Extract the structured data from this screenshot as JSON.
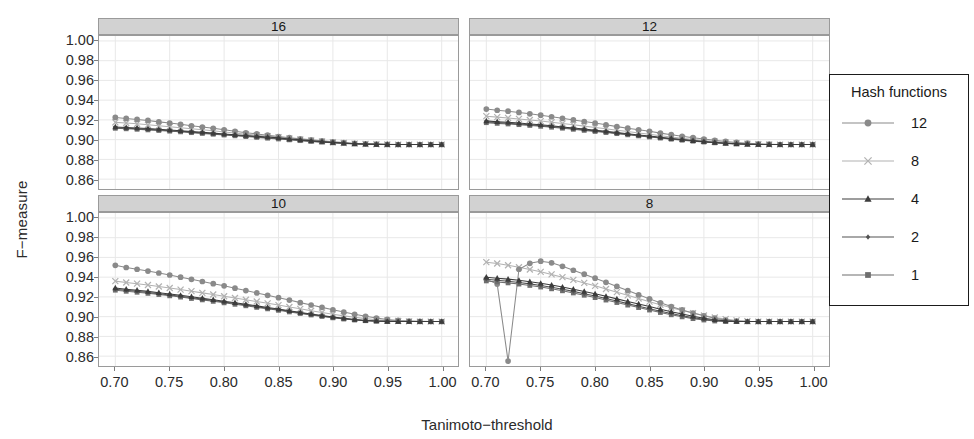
{
  "chart_data": {
    "type": "line",
    "title": "",
    "xlabel": "Tanimoto−threshold",
    "ylabel": "F−measure",
    "xlim": [
      0.685,
      1.015
    ],
    "ylim": [
      0.85,
      1.005
    ],
    "xticks": [
      "0.70",
      "0.75",
      "0.80",
      "0.85",
      "0.90",
      "0.95",
      "1.00"
    ],
    "xtick_values": [
      0.7,
      0.75,
      0.8,
      0.85,
      0.9,
      0.95,
      1.0
    ],
    "yticks": [
      "1.00",
      "0.98",
      "0.96",
      "0.94",
      "0.92",
      "0.90",
      "0.88",
      "0.86"
    ],
    "ytick_values": [
      1.0,
      0.98,
      0.96,
      0.94,
      0.92,
      0.9,
      0.88,
      0.86
    ],
    "grid": true,
    "grid_color": "#e8e8e8",
    "legend": {
      "title": "Hash functions",
      "position": "right",
      "entries": [
        {
          "label": "12",
          "marker": "circle",
          "color": "#8a8a8a"
        },
        {
          "label": "8",
          "marker": "cross",
          "color": "#b2b2b2"
        },
        {
          "label": "4",
          "marker": "triangle",
          "color": "#3c3c3c"
        },
        {
          "label": "2",
          "marker": "diamond",
          "color": "#525252"
        },
        {
          "label": "1",
          "marker": "square",
          "color": "#6e6e6e"
        }
      ]
    },
    "facet_variable": "Bits",
    "facets": [
      {
        "strip": "16",
        "row": 0,
        "col": 0,
        "x": [
          0.7,
          0.71,
          0.72,
          0.73,
          0.74,
          0.75,
          0.76,
          0.77,
          0.78,
          0.79,
          0.8,
          0.81,
          0.82,
          0.83,
          0.84,
          0.85,
          0.86,
          0.87,
          0.88,
          0.89,
          0.9,
          0.91,
          0.92,
          0.93,
          0.94,
          0.95,
          0.96,
          0.97,
          0.98,
          0.99,
          1.0
        ],
        "series": [
          {
            "name": "12",
            "values": [
              0.9225,
              0.9215,
              0.9205,
              0.9195,
              0.918,
              0.9168,
              0.9155,
              0.914,
              0.9128,
              0.9115,
              0.91,
              0.9085,
              0.907,
              0.9058,
              0.9045,
              0.9032,
              0.902,
              0.9008,
              0.8998,
              0.8988,
              0.8978,
              0.897,
              0.8962,
              0.8958,
              0.8955,
              0.8952,
              0.895,
              0.895,
              0.895,
              0.895,
              0.895
            ]
          },
          {
            "name": "8",
            "values": [
              0.9175,
              0.9168,
              0.916,
              0.915,
              0.914,
              0.913,
              0.912,
              0.911,
              0.91,
              0.909,
              0.9078,
              0.9068,
              0.9055,
              0.9045,
              0.9035,
              0.9025,
              0.9012,
              0.9002,
              0.8992,
              0.8982,
              0.8974,
              0.8966,
              0.896,
              0.8956,
              0.8953,
              0.8951,
              0.895,
              0.895,
              0.895,
              0.895,
              0.895
            ]
          },
          {
            "name": "4",
            "values": [
              0.9128,
              0.9122,
              0.9118,
              0.9112,
              0.9105,
              0.9098,
              0.909,
              0.9082,
              0.9074,
              0.9066,
              0.9058,
              0.905,
              0.9042,
              0.9034,
              0.9026,
              0.9018,
              0.9006,
              0.8998,
              0.8988,
              0.898,
              0.8972,
              0.8965,
              0.8959,
              0.8955,
              0.8952,
              0.8951,
              0.895,
              0.895,
              0.895,
              0.895,
              0.895
            ]
          },
          {
            "name": "2",
            "values": [
              0.912,
              0.9115,
              0.911,
              0.9104,
              0.9098,
              0.9091,
              0.9084,
              0.9076,
              0.9068,
              0.906,
              0.9052,
              0.9044,
              0.9036,
              0.9028,
              0.902,
              0.9012,
              0.9002,
              0.8994,
              0.8985,
              0.8977,
              0.897,
              0.8963,
              0.8958,
              0.8954,
              0.8952,
              0.8951,
              0.895,
              0.895,
              0.895,
              0.895,
              0.895
            ]
          },
          {
            "name": "1",
            "values": [
              0.9115,
              0.911,
              0.9105,
              0.9099,
              0.9093,
              0.9086,
              0.9079,
              0.9071,
              0.9063,
              0.9055,
              0.9047,
              0.9039,
              0.9031,
              0.9023,
              0.9015,
              0.9007,
              0.8998,
              0.899,
              0.8982,
              0.8975,
              0.8968,
              0.8962,
              0.8957,
              0.8953,
              0.8951,
              0.895,
              0.895,
              0.895,
              0.895,
              0.895,
              0.895
            ]
          }
        ]
      },
      {
        "strip": "12",
        "row": 0,
        "col": 1,
        "x": [
          0.7,
          0.71,
          0.72,
          0.73,
          0.74,
          0.75,
          0.76,
          0.77,
          0.78,
          0.79,
          0.8,
          0.81,
          0.82,
          0.83,
          0.84,
          0.85,
          0.86,
          0.87,
          0.88,
          0.89,
          0.9,
          0.91,
          0.92,
          0.93,
          0.94,
          0.95,
          0.96,
          0.97,
          0.98,
          0.99,
          1.0
        ],
        "series": [
          {
            "name": "12",
            "values": [
              0.931,
              0.9298,
              0.9288,
              0.9276,
              0.9262,
              0.9248,
              0.9232,
              0.9216,
              0.92,
              0.9184,
              0.9168,
              0.915,
              0.9132,
              0.9116,
              0.91,
              0.9084,
              0.9066,
              0.905,
              0.9034,
              0.902,
              0.9006,
              0.8994,
              0.8982,
              0.8972,
              0.8964,
              0.8958,
              0.8954,
              0.8951,
              0.895,
              0.895,
              0.895
            ]
          },
          {
            "name": "8",
            "values": [
              0.9238,
              0.9228,
              0.922,
              0.921,
              0.9199,
              0.9188,
              0.9176,
              0.9163,
              0.915,
              0.9137,
              0.9124,
              0.911,
              0.9096,
              0.9082,
              0.9068,
              0.9054,
              0.904,
              0.9026,
              0.9014,
              0.9002,
              0.899,
              0.898,
              0.8971,
              0.8964,
              0.8958,
              0.8954,
              0.8951,
              0.895,
              0.895,
              0.895,
              0.895
            ]
          },
          {
            "name": "4",
            "values": [
              0.919,
              0.9182,
              0.9176,
              0.9168,
              0.9159,
              0.915,
              0.914,
              0.9129,
              0.9118,
              0.9107,
              0.9096,
              0.9084,
              0.9072,
              0.906,
              0.9048,
              0.9036,
              0.9024,
              0.9012,
              0.9001,
              0.899,
              0.898,
              0.8971,
              0.8964,
              0.8958,
              0.8954,
              0.8951,
              0.895,
              0.895,
              0.895,
              0.895,
              0.895
            ]
          },
          {
            "name": "2",
            "values": [
              0.918,
              0.9173,
              0.9167,
              0.9159,
              0.9151,
              0.9142,
              0.9132,
              0.9122,
              0.9111,
              0.91,
              0.9089,
              0.9078,
              0.9066,
              0.9054,
              0.9043,
              0.9031,
              0.902,
              0.9008,
              0.8998,
              0.8988,
              0.8978,
              0.897,
              0.8963,
              0.8957,
              0.8953,
              0.8951,
              0.895,
              0.895,
              0.895,
              0.895,
              0.895
            ]
          },
          {
            "name": "1",
            "values": [
              0.9172,
              0.9165,
              0.9159,
              0.9152,
              0.9144,
              0.9135,
              0.9126,
              0.9116,
              0.9105,
              0.9094,
              0.9083,
              0.9072,
              0.9061,
              0.9049,
              0.9038,
              0.9027,
              0.9016,
              0.9005,
              0.8995,
              0.8985,
              0.8976,
              0.8968,
              0.8962,
              0.8956,
              0.8953,
              0.8951,
              0.895,
              0.895,
              0.895,
              0.895,
              0.895
            ]
          }
        ]
      },
      {
        "strip": "10",
        "row": 1,
        "col": 0,
        "x": [
          0.7,
          0.71,
          0.72,
          0.73,
          0.74,
          0.75,
          0.76,
          0.77,
          0.78,
          0.79,
          0.8,
          0.81,
          0.82,
          0.83,
          0.84,
          0.85,
          0.86,
          0.87,
          0.88,
          0.89,
          0.9,
          0.91,
          0.92,
          0.93,
          0.94,
          0.95,
          0.96,
          0.97,
          0.98,
          0.99,
          1.0
        ],
        "series": [
          {
            "name": "12",
            "values": [
              0.952,
              0.9498,
              0.948,
              0.9462,
              0.9442,
              0.9422,
              0.94,
              0.9378,
              0.9356,
              0.9334,
              0.9312,
              0.9288,
              0.9264,
              0.924,
              0.9216,
              0.9192,
              0.9168,
              0.9142,
              0.9118,
              0.9094,
              0.907,
              0.9046,
              0.9024,
              0.9004,
              0.8986,
              0.8972,
              0.8962,
              0.8956,
              0.8952,
              0.895,
              0.895
            ]
          },
          {
            "name": "8",
            "values": [
              0.936,
              0.9346,
              0.9334,
              0.932,
              0.9305,
              0.929,
              0.9274,
              0.9258,
              0.9241,
              0.9224,
              0.9207,
              0.9189,
              0.9171,
              0.9153,
              0.9135,
              0.9117,
              0.9098,
              0.9079,
              0.906,
              0.9042,
              0.9024,
              0.9008,
              0.8993,
              0.898,
              0.8969,
              0.8961,
              0.8956,
              0.8952,
              0.895,
              0.895,
              0.895
            ]
          },
          {
            "name": "4",
            "values": [
              0.929,
              0.9278,
              0.9268,
              0.9256,
              0.9243,
              0.923,
              0.9216,
              0.9202,
              0.9187,
              0.9172,
              0.9157,
              0.9141,
              0.9125,
              0.9109,
              0.9093,
              0.9077,
              0.906,
              0.9043,
              0.9027,
              0.9011,
              0.8996,
              0.8983,
              0.8971,
              0.8962,
              0.8956,
              0.8952,
              0.895,
              0.895,
              0.895,
              0.895,
              0.895
            ]
          },
          {
            "name": "2",
            "values": [
              0.9278,
              0.9267,
              0.9257,
              0.9245,
              0.9233,
              0.922,
              0.9206,
              0.9192,
              0.9178,
              0.9163,
              0.9148,
              0.9133,
              0.9117,
              0.9101,
              0.9086,
              0.907,
              0.9054,
              0.9038,
              0.9022,
              0.9007,
              0.8992,
              0.898,
              0.8969,
              0.8961,
              0.8955,
              0.8952,
              0.895,
              0.895,
              0.895,
              0.895,
              0.895
            ]
          },
          {
            "name": "1",
            "values": [
              0.9268,
              0.9257,
              0.9247,
              0.9236,
              0.9224,
              0.9211,
              0.9198,
              0.9184,
              0.917,
              0.9155,
              0.914,
              0.9125,
              0.911,
              0.9094,
              0.9079,
              0.9064,
              0.9048,
              0.9032,
              0.9017,
              0.9002,
              0.8988,
              0.8976,
              0.8966,
              0.8959,
              0.8954,
              0.8951,
              0.895,
              0.895,
              0.895,
              0.895,
              0.895
            ]
          }
        ]
      },
      {
        "strip": "8",
        "row": 1,
        "col": 1,
        "x": [
          0.7,
          0.71,
          0.72,
          0.73,
          0.74,
          0.75,
          0.76,
          0.77,
          0.78,
          0.79,
          0.8,
          0.81,
          0.82,
          0.83,
          0.84,
          0.85,
          0.86,
          0.87,
          0.88,
          0.89,
          0.9,
          0.91,
          0.92,
          0.93,
          0.94,
          0.95,
          0.96,
          0.97,
          0.98,
          0.99,
          1.0
        ],
        "series": [
          {
            "name": "12",
            "values": [
              0.938,
              0.933,
              0.855,
              0.948,
              0.954,
              0.9562,
              0.9545,
              0.951,
              0.947,
              0.943,
              0.939,
              0.9348,
              0.9306,
              0.9264,
              0.9222,
              0.918,
              0.914,
              0.9102,
              0.9068,
              0.9036,
              0.9008,
              0.8984,
              0.8966,
              0.8956,
              0.8951,
              0.895,
              0.895,
              0.895,
              0.895,
              0.895,
              0.895
            ]
          },
          {
            "name": "8",
            "values": [
              0.9552,
              0.9538,
              0.952,
              0.95,
              0.9478,
              0.9454,
              0.9428,
              0.94,
              0.9372,
              0.9342,
              0.9312,
              0.928,
              0.9248,
              0.9216,
              0.9184,
              0.9152,
              0.912,
              0.909,
              0.9062,
              0.9036,
              0.9012,
              0.8992,
              0.8975,
              0.8962,
              0.8954,
              0.895,
              0.895,
              0.895,
              0.895,
              0.895,
              0.895
            ]
          },
          {
            "name": "4",
            "values": [
              0.94,
              0.939,
              0.938,
              0.9368,
              0.9354,
              0.9338,
              0.932,
              0.93,
              0.9278,
              0.9255,
              0.9231,
              0.9206,
              0.918,
              0.9154,
              0.9128,
              0.9102,
              0.9076,
              0.905,
              0.9026,
              0.9004,
              0.8984,
              0.8968,
              0.8957,
              0.8951,
              0.895,
              0.895,
              0.895,
              0.895,
              0.895,
              0.895,
              0.895
            ]
          },
          {
            "name": "2",
            "values": [
              0.9378,
              0.9368,
              0.9358,
              0.9346,
              0.9332,
              0.9316,
              0.9298,
              0.9278,
              0.9256,
              0.9233,
              0.9209,
              0.9184,
              0.9158,
              0.9132,
              0.9106,
              0.908,
              0.9055,
              0.9031,
              0.9009,
              0.899,
              0.8974,
              0.8962,
              0.8954,
              0.895,
              0.895,
              0.895,
              0.895,
              0.895,
              0.895,
              0.895,
              0.895
            ]
          },
          {
            "name": "1",
            "values": [
              0.9362,
              0.9352,
              0.9342,
              0.933,
              0.9316,
              0.93,
              0.9282,
              0.9262,
              0.924,
              0.9217,
              0.9193,
              0.9168,
              0.9143,
              0.9117,
              0.9092,
              0.9067,
              0.9042,
              0.9019,
              0.8998,
              0.898,
              0.8966,
              0.8956,
              0.8951,
              0.895,
              0.895,
              0.895,
              0.895,
              0.895,
              0.895,
              0.895,
              0.895
            ]
          }
        ]
      }
    ]
  }
}
